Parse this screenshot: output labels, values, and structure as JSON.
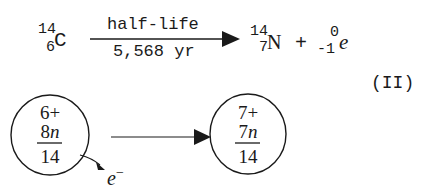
{
  "equation": {
    "reactant": {
      "symbol": "C",
      "mass_number": "14",
      "atomic_number": "6"
    },
    "arrow": {
      "label_above": "half-life",
      "label_below": "5,568 yr"
    },
    "product": {
      "symbol": "N",
      "mass_number": "14",
      "atomic_number": "7"
    },
    "plus": "+",
    "emitted": {
      "symbol": "e",
      "mass_number": "0",
      "atomic_number": "-1"
    },
    "equation_number": "(II)"
  },
  "nucleus_diagram": {
    "before": {
      "protons": "6+",
      "neutrons": "8n",
      "total": "14"
    },
    "after": {
      "protons": "7+",
      "neutrons": "7n",
      "total": "14"
    },
    "emitted_particle": "e",
    "emitted_charge": "−"
  }
}
